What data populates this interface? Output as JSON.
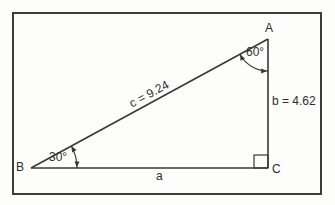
{
  "figure": {
    "type": "right-triangle-diagram",
    "vertices": {
      "a": "A",
      "b": "B",
      "c": "C"
    },
    "sides": {
      "a": "a",
      "b": "b = 4.62",
      "c": "c = 9.24"
    },
    "angles": {
      "at_b": "30°",
      "at_a": "60°"
    },
    "right_angle_at": "C"
  },
  "colors": {
    "line": "#383838",
    "text": "#2d2d2d",
    "frame_border": "#3c3c3c",
    "background": "#fdfdfb"
  }
}
